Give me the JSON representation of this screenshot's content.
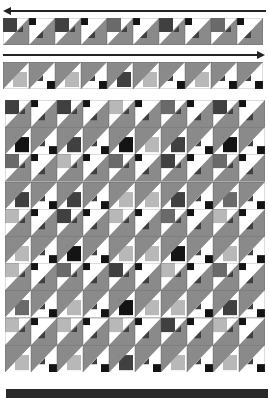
{
  "diagram": {
    "title": "",
    "colors": {
      "gray": "#8a8a8a",
      "dark": "#404040",
      "black": "#141414",
      "light": "#b8b8b8",
      "mid": "#6a6a6a",
      "white": "#ffffff",
      "line": "#222222",
      "bar": "#2a2a2a"
    },
    "strip_top": {
      "direction": "left",
      "blocks": [
        {
          "type": "A",
          "c": "dark"
        },
        {
          "type": "A2",
          "c": "black"
        },
        {
          "type": "A",
          "c": "dark"
        },
        {
          "type": "A2",
          "c": "black"
        },
        {
          "type": "A",
          "c": "mid"
        },
        {
          "type": "A2",
          "c": "black"
        },
        {
          "type": "A",
          "c": "dark"
        },
        {
          "type": "A2",
          "c": "black"
        },
        {
          "type": "A",
          "c": "mid"
        },
        {
          "type": "A2",
          "c": "black"
        }
      ]
    },
    "strip_bottom": {
      "direction": "right",
      "blocks": [
        {
          "type": "B",
          "c": "light"
        },
        {
          "type": "B2",
          "c": "black"
        },
        {
          "type": "B",
          "c": "light"
        },
        {
          "type": "B2",
          "c": "black"
        },
        {
          "type": "B",
          "c": "dark"
        },
        {
          "type": "B",
          "c": "light"
        },
        {
          "type": "B2",
          "c": "black"
        },
        {
          "type": "B",
          "c": "light"
        },
        {
          "type": "B2",
          "c": "black"
        },
        {
          "type": "B2",
          "c": "black"
        }
      ]
    },
    "grid": {
      "rows": [
        [
          {
            "t": "A",
            "c": "dark"
          },
          {
            "t": "A2",
            "c": "black"
          },
          {
            "t": "A",
            "c": "dark"
          },
          {
            "t": "A2",
            "c": "black"
          },
          {
            "t": "A",
            "c": "light"
          },
          {
            "t": "A2",
            "c": "black"
          },
          {
            "t": "A",
            "c": "mid"
          },
          {
            "t": "A2",
            "c": "black"
          },
          {
            "t": "A",
            "c": "dark"
          },
          {
            "t": "A2",
            "c": "black"
          }
        ],
        [
          {
            "t": "B",
            "c": "black"
          },
          {
            "t": "B2",
            "c": "black"
          },
          {
            "t": "B",
            "c": "dark"
          },
          {
            "t": "B2",
            "c": "black"
          },
          {
            "t": "B",
            "c": "black"
          },
          {
            "t": "B",
            "c": "light"
          },
          {
            "t": "B",
            "c": "dark"
          },
          {
            "t": "B2",
            "c": "black"
          },
          {
            "t": "B",
            "c": "black"
          },
          {
            "t": "B2",
            "c": "black"
          }
        ],
        [
          {
            "t": "A",
            "c": "mid"
          },
          {
            "t": "A2",
            "c": "black"
          },
          {
            "t": "A",
            "c": "light"
          },
          {
            "t": "A2",
            "c": "black"
          },
          {
            "t": "A",
            "c": "mid"
          },
          {
            "t": "A2",
            "c": "black"
          },
          {
            "t": "A",
            "c": "dark"
          },
          {
            "t": "A2",
            "c": "black"
          },
          {
            "t": "A",
            "c": "mid"
          },
          {
            "t": "A2",
            "c": "black"
          }
        ],
        [
          {
            "t": "B",
            "c": "dark"
          },
          {
            "t": "B2",
            "c": "black"
          },
          {
            "t": "B",
            "c": "dark"
          },
          {
            "t": "B2",
            "c": "black"
          },
          {
            "t": "B",
            "c": "light"
          },
          {
            "t": "B",
            "c": "light"
          },
          {
            "t": "B",
            "c": "dark"
          },
          {
            "t": "B2",
            "c": "black"
          },
          {
            "t": "B",
            "c": "mid"
          },
          {
            "t": "B2",
            "c": "black"
          }
        ],
        [
          {
            "t": "A",
            "c": "light"
          },
          {
            "t": "A2",
            "c": "black"
          },
          {
            "t": "A",
            "c": "dark"
          },
          {
            "t": "A2",
            "c": "black"
          },
          {
            "t": "A",
            "c": "light"
          },
          {
            "t": "A2",
            "c": "black"
          },
          {
            "t": "A",
            "c": "mid"
          },
          {
            "t": "A2",
            "c": "black"
          },
          {
            "t": "A",
            "c": "light"
          },
          {
            "t": "A2",
            "c": "black"
          }
        ],
        [
          {
            "t": "B",
            "c": "light"
          },
          {
            "t": "B2",
            "c": "black"
          },
          {
            "t": "B",
            "c": "black"
          },
          {
            "t": "B2",
            "c": "black"
          },
          {
            "t": "B",
            "c": "light"
          },
          {
            "t": "B",
            "c": "light"
          },
          {
            "t": "B",
            "c": "black"
          },
          {
            "t": "B2",
            "c": "black"
          },
          {
            "t": "B",
            "c": "light"
          },
          {
            "t": "B2",
            "c": "black"
          }
        ],
        [
          {
            "t": "A",
            "c": "light"
          },
          {
            "t": "A2",
            "c": "black"
          },
          {
            "t": "A",
            "c": "mid"
          },
          {
            "t": "A2",
            "c": "black"
          },
          {
            "t": "A",
            "c": "dark"
          },
          {
            "t": "A2",
            "c": "black"
          },
          {
            "t": "A",
            "c": "light"
          },
          {
            "t": "A2",
            "c": "black"
          },
          {
            "t": "A",
            "c": "mid"
          },
          {
            "t": "A2",
            "c": "black"
          }
        ],
        [
          {
            "t": "B",
            "c": "mid"
          },
          {
            "t": "B2",
            "c": "black"
          },
          {
            "t": "B",
            "c": "light"
          },
          {
            "t": "B2",
            "c": "black"
          },
          {
            "t": "B",
            "c": "black"
          },
          {
            "t": "B",
            "c": "light"
          },
          {
            "t": "B",
            "c": "light"
          },
          {
            "t": "B2",
            "c": "black"
          },
          {
            "t": "B",
            "c": "dark"
          },
          {
            "t": "B2",
            "c": "black"
          }
        ],
        [
          {
            "t": "A",
            "c": "light"
          },
          {
            "t": "A2",
            "c": "black"
          },
          {
            "t": "A",
            "c": "light"
          },
          {
            "t": "A2",
            "c": "black"
          },
          {
            "t": "A",
            "c": "light"
          },
          {
            "t": "A2",
            "c": "black"
          },
          {
            "t": "A",
            "c": "dark"
          },
          {
            "t": "A2",
            "c": "black"
          },
          {
            "t": "A",
            "c": "light"
          },
          {
            "t": "A2",
            "c": "black"
          }
        ],
        [
          {
            "t": "B",
            "c": "light"
          },
          {
            "t": "B2",
            "c": "black"
          },
          {
            "t": "B",
            "c": "light"
          },
          {
            "t": "B2",
            "c": "black"
          },
          {
            "t": "B",
            "c": "dark"
          },
          {
            "t": "B2",
            "c": "black"
          },
          {
            "t": "B",
            "c": "light"
          },
          {
            "t": "B2",
            "c": "black"
          },
          {
            "t": "B",
            "c": "light"
          },
          {
            "t": "B2",
            "c": "black"
          }
        ]
      ]
    }
  }
}
